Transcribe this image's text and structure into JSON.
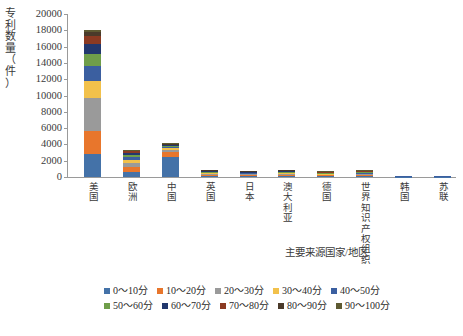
{
  "chart_data": {
    "type": "bar",
    "subtype": "stacked-column",
    "title": "",
    "xlabel": "主要来源国家/地区",
    "ylabel": "专利数量（件）",
    "ylim": [
      0,
      20000
    ],
    "ytick_interval": 2000,
    "ytick_labels": [
      "20000",
      "18000",
      "16000",
      "14000",
      "12000",
      "10000",
      "8000",
      "6000",
      "4000",
      "2000",
      "0"
    ],
    "grid": false,
    "legend_position": "bottom",
    "categories": [
      "美国",
      "欧洲",
      "中国",
      "英国",
      "日本",
      "澳大利亚",
      "德国",
      "世界知识产权组织",
      "韩国",
      "苏联"
    ],
    "series": [
      {
        "name": "0～10分",
        "color": "#4472a8",
        "values": [
          2800,
          600,
          2550,
          180,
          150,
          170,
          140,
          170,
          40,
          40
        ]
      },
      {
        "name": "10～20分",
        "color": "#e8762c",
        "values": [
          2900,
          620,
          560,
          120,
          110,
          120,
          95,
          110,
          25,
          25
        ]
      },
      {
        "name": "20～30分",
        "color": "#9a9a9a",
        "values": [
          4000,
          520,
          300,
          110,
          95,
          110,
          85,
          100,
          20,
          20
        ]
      },
      {
        "name": "30～40分",
        "color": "#f2c14b",
        "values": [
          2100,
          420,
          220,
          100,
          85,
          100,
          75,
          90,
          18,
          18
        ]
      },
      {
        "name": "40～50分",
        "color": "#3b5fa0",
        "values": [
          1800,
          330,
          170,
          95,
          80,
          95,
          70,
          85,
          15,
          15
        ]
      },
      {
        "name": "50～60分",
        "color": "#6f9e4a",
        "values": [
          1500,
          300,
          120,
          90,
          75,
          90,
          65,
          80,
          12,
          12
        ]
      },
      {
        "name": "60～70分",
        "color": "#22386e",
        "values": [
          1200,
          250,
          90,
          80,
          70,
          80,
          58,
          70,
          10,
          10
        ]
      },
      {
        "name": "70～80分",
        "color": "#8b3a22",
        "values": [
          1000,
          150,
          60,
          60,
          55,
          60,
          45,
          55,
          8,
          8
        ]
      },
      {
        "name": "80～90分",
        "color": "#4a3a2a",
        "values": [
          500,
          80,
          30,
          40,
          35,
          40,
          30,
          35,
          6,
          6
        ]
      },
      {
        "name": "90～100分",
        "color": "#5e5a32",
        "values": [
          200,
          30,
          15,
          25,
          20,
          25,
          17,
          20,
          4,
          4
        ]
      }
    ],
    "totals": [
      18000,
      3300,
      4115,
      900,
      775,
      890,
      680,
      815,
      158,
      158
    ]
  },
  "legend": {
    "rows": [
      [
        {
          "label": "0～10分",
          "color": "#4472a8"
        },
        {
          "label": "10～20分",
          "color": "#e8762c"
        },
        {
          "label": "20～30分",
          "color": "#9a9a9a"
        },
        {
          "label": "30～40分",
          "color": "#f2c14b"
        },
        {
          "label": "40～50分",
          "color": "#3b5fa0"
        }
      ],
      [
        {
          "label": "50～60分",
          "color": "#6f9e4a"
        },
        {
          "label": "60～70分",
          "color": "#22386e"
        },
        {
          "label": "70～80分",
          "color": "#8b3a22"
        },
        {
          "label": "80～90分",
          "color": "#4a3a2a"
        },
        {
          "label": "90～100分",
          "color": "#5e5a32"
        }
      ]
    ]
  },
  "axes": {
    "y_title": "专利\n数量\n（件\n）",
    "y_title_chars": [
      "专",
      "利",
      "数",
      "量",
      "（",
      "件",
      "）"
    ],
    "x_title": "主要来源国家/地区"
  }
}
